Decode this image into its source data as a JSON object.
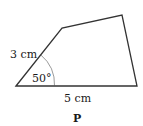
{
  "figure": {
    "shape_name": "P",
    "side_left_label": "3 cm",
    "side_bottom_label": "5 cm",
    "angle_label": "50°",
    "stroke_color": "#333333",
    "vertices": {
      "bottom_left": [
        16,
        86
      ],
      "top_left": [
        62,
        28
      ],
      "top_right": [
        122,
        15
      ],
      "bottom_right": [
        137,
        86
      ]
    }
  }
}
